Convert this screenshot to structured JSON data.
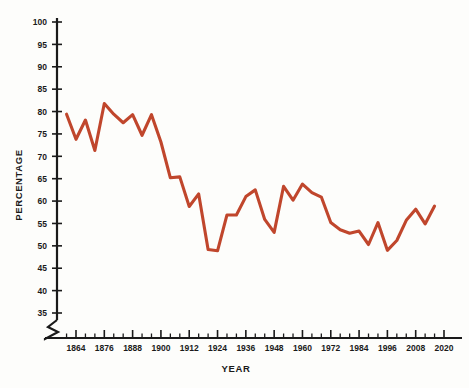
{
  "chart_data": {
    "type": "line",
    "title": "",
    "xlabel": "YEAR",
    "ylabel": "PERCENTAGE",
    "ylim": [
      35,
      100
    ],
    "xlim": [
      1858,
      2022
    ],
    "grid": false,
    "legend": null,
    "axis_break_y": true,
    "y_ticks": [
      35,
      40,
      45,
      50,
      55,
      60,
      65,
      70,
      75,
      80,
      85,
      90,
      95,
      100
    ],
    "x_ticks_major": [
      1864,
      1876,
      1888,
      1900,
      1912,
      1924,
      1936,
      1948,
      1960,
      1972,
      1984,
      1996,
      2008,
      2020
    ],
    "x_tick_minor_step": 4,
    "series": [
      {
        "name": "Voter turnout",
        "color": "#c0462c",
        "x": [
          1860,
          1864,
          1868,
          1872,
          1876,
          1880,
          1884,
          1888,
          1892,
          1896,
          1900,
          1904,
          1908,
          1912,
          1916,
          1920,
          1924,
          1928,
          1932,
          1936,
          1940,
          1944,
          1948,
          1952,
          1956,
          1960,
          1964,
          1968,
          1972,
          1976,
          1980,
          1984,
          1988,
          1992,
          1996,
          2000,
          2004,
          2008,
          2012,
          2016
        ],
        "values": [
          79.4,
          73.8,
          78.1,
          71.3,
          81.8,
          79.4,
          77.5,
          79.3,
          74.7,
          79.3,
          73.2,
          65.2,
          65.4,
          58.8,
          61.6,
          49.2,
          48.9,
          56.9,
          56.9,
          61.0,
          62.5,
          55.9,
          53.0,
          63.3,
          60.2,
          63.8,
          61.9,
          60.9,
          55.2,
          53.6,
          52.8,
          53.3,
          50.3,
          55.2,
          49.0,
          51.2,
          55.7,
          58.2,
          54.9,
          58.9
        ]
      }
    ]
  },
  "axes": {
    "y_title": "PERCENTAGE",
    "x_title": "YEAR"
  }
}
